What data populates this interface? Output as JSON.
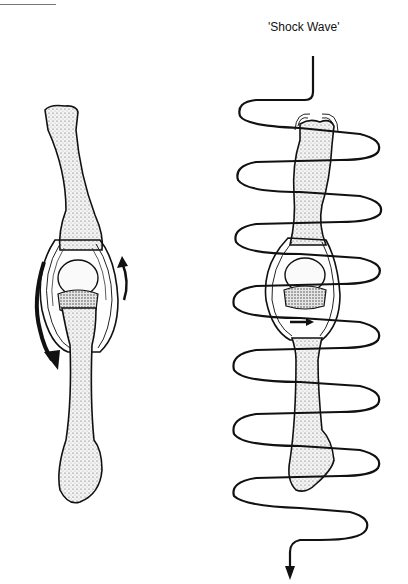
{
  "figure": {
    "type": "anatomical-illustration",
    "left_panel": {
      "description": "finger bone joint with rotation arrows",
      "arrows": [
        "large-curved-arrow-left-down",
        "small-curved-arrow-right-up"
      ]
    },
    "right_panel": {
      "label": "'Shock Wave'",
      "description": "finger bone joint with helical shock wave passing through it, ending in a downward arrow",
      "wave_loops": 8
    }
  },
  "colors": {
    "ink": "#111111",
    "bone_fill": "#f2f2f2",
    "background": "#ffffff"
  }
}
